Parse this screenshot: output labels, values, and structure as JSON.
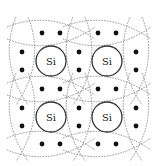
{
  "diagram": {
    "atom_label": "Si",
    "atoms": [
      {
        "label": "Si",
        "cx": 51,
        "cy": 61
      },
      {
        "label": "Si",
        "cx": 107,
        "cy": 61
      },
      {
        "label": "Si",
        "cx": 51,
        "cy": 117
      },
      {
        "label": "Si",
        "cx": 107,
        "cy": 117
      }
    ],
    "atom_radius": 15,
    "bond_pairs": {
      "horizontal": [
        {
          "cx": 51,
          "cy": 33
        },
        {
          "cx": 107,
          "cy": 33
        },
        {
          "cx": 51,
          "cy": 89
        },
        {
          "cx": 107,
          "cy": 89
        },
        {
          "cx": 51,
          "cy": 144
        },
        {
          "cx": 107,
          "cy": 144
        }
      ],
      "vertical": [
        {
          "cx": 22,
          "cy": 61
        },
        {
          "cx": 79,
          "cy": 61
        },
        {
          "cx": 136,
          "cy": 61
        },
        {
          "cx": 22,
          "cy": 117
        },
        {
          "cx": 79,
          "cy": 117
        },
        {
          "cx": 136,
          "cy": 117
        }
      ]
    },
    "electrons_per_bond": 2,
    "colors": {
      "electron": "#111111",
      "atom_ring": "#333333",
      "bond_outline": "#777777",
      "background": "#ffffff"
    }
  }
}
